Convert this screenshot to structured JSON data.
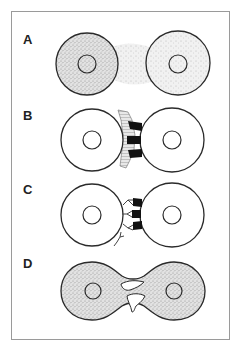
{
  "figure": {
    "panels": [
      {
        "id": "A",
        "label": "A",
        "description": "Two cells with stippled cytoplasm and diffuse signal between them"
      },
      {
        "id": "B",
        "label": "B",
        "description": "Two cells contacting with hatched extracellular material and dark junctional adhesions"
      },
      {
        "id": "C",
        "label": "C",
        "description": "Two cells connected by branching receptor-like molecules and dark junction plugs"
      },
      {
        "id": "D",
        "label": "D",
        "description": "Two stippled cells fused into a dumbbell shape with cytoplasmic bridges"
      }
    ],
    "colors": {
      "stroke": "#2a2a2a",
      "stipple": "#bdbdbd",
      "junction": "#111111",
      "frame": "#9a9a9a",
      "background": "#ffffff"
    }
  }
}
